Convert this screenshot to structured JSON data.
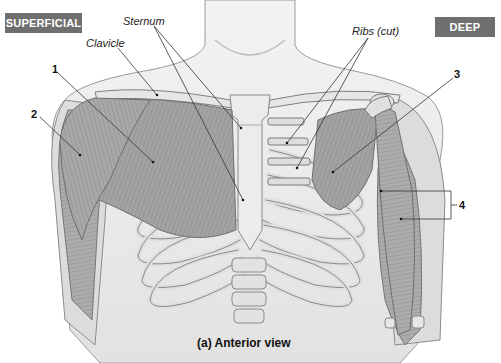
{
  "figure": {
    "badges": {
      "superficial": "SUPERFICIAL",
      "deep": "DEEP",
      "badge_color": "#6f6f6f"
    },
    "labels": {
      "sternum": "Sternum",
      "clavicle": "Clavicle",
      "ribs_cut": "Ribs (cut)"
    },
    "numbered_callouts": [
      "1",
      "2",
      "3",
      "4"
    ],
    "caption": "(a) Anterior view",
    "colors": {
      "muscle": "#9a9a9a",
      "bone": "#e4e4e4",
      "skin": "#e9e9e9",
      "outline": "#777777",
      "leader_line": "#333333"
    }
  }
}
